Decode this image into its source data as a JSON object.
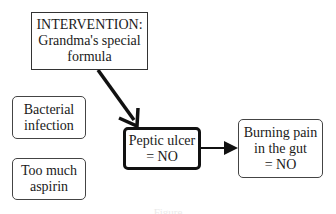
{
  "diagram": {
    "intervention": {
      "lines": [
        "INTERVENTION:",
        "Grandma's special",
        "formula"
      ]
    },
    "bacterial": {
      "lines": [
        "Bacterial",
        "infection"
      ]
    },
    "aspirin": {
      "lines": [
        "Too much",
        "aspirin"
      ]
    },
    "peptic": {
      "lines": [
        "Peptic ulcer",
        "= NO"
      ]
    },
    "burning": {
      "lines": [
        "Burning pain",
        "in the gut",
        "= NO"
      ]
    },
    "edges": [
      {
        "from": "intervention",
        "to": "peptic"
      },
      {
        "from": "peptic",
        "to": "burning"
      }
    ],
    "caption": "Figure"
  }
}
